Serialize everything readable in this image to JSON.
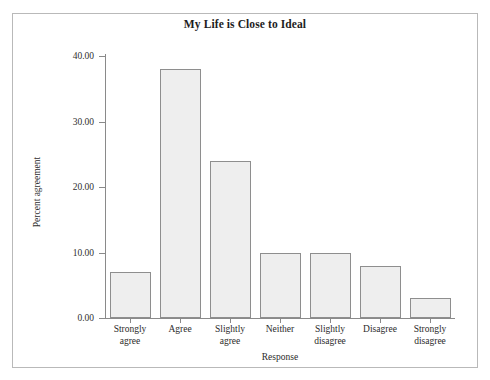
{
  "chart_data": {
    "type": "bar",
    "title": "My Life is Close to Ideal",
    "xlabel": "Response",
    "ylabel": "Percent agreement",
    "categories": [
      "Strongly agree",
      "Agree",
      "Slightly agree",
      "Neither",
      "Slightly disagree",
      "Disagree",
      "Strongly disagree"
    ],
    "category_lines": [
      [
        "Strongly",
        "agree"
      ],
      [
        "Agree",
        ""
      ],
      [
        "Slightly",
        "agree"
      ],
      [
        "Neither",
        ""
      ],
      [
        "Slightly",
        "disagree"
      ],
      [
        "Disagree",
        ""
      ],
      [
        "Strongly",
        "disagree"
      ]
    ],
    "values": [
      7,
      38,
      24,
      10,
      10,
      8,
      3
    ],
    "ylim": [
      0,
      40
    ],
    "ytick_labels": [
      "0.00",
      "10.00",
      "20.00",
      "30.00",
      "40.00"
    ],
    "ytick_values": [
      0,
      10,
      20,
      30,
      40
    ],
    "grid": false,
    "legend": "none",
    "bar_fill_color": "#eeeeee",
    "bar_border_color": "#8e8e8e",
    "axis_color": "#8a8a8a",
    "frame_color": "#b9b9b9",
    "background_color": "#ffffff"
  }
}
